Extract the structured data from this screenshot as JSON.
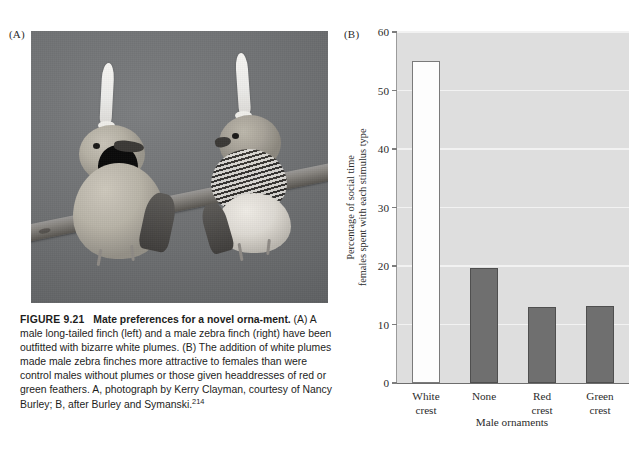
{
  "panels": {
    "a_label": "(A)",
    "b_label": "(B)"
  },
  "photo": {
    "alt_name": "two-finches-with-white-plumes-on-branch",
    "background_color": "#6f7173",
    "left_bird": "male long-tailed finch",
    "right_bird": "male zebra finch"
  },
  "caption": {
    "figure_number": "FIGURE 9.21",
    "title": "Mate preferences for a novel orna-­ment.",
    "body": " (A) A male long-tailed finch (left) and a male zebra finch (right) have been outfitted with bizarre white plumes. (B) The addition of white plumes made male zebra finches more attractive to females than were control males without plumes or those given headdresses of red or green feathers. A, photograph by Kerry Clayman, courtesy of Nancy Burley; B, after Burley and Symanski.",
    "reference": "214"
  },
  "chart_data": {
    "type": "bar",
    "title": "",
    "xlabel": "Male ornaments",
    "ylabel": "Percentage of social time females spent with each stimulus type",
    "ylabel_line1": "Percentage of social time",
    "ylabel_line2": "females spent with each stimulus type",
    "categories": [
      "White crest",
      "None",
      "Red crest",
      "Green crest"
    ],
    "category_lines": [
      [
        "White",
        "crest"
      ],
      [
        "None",
        ""
      ],
      [
        "Red",
        "crest"
      ],
      [
        "Green",
        "crest"
      ]
    ],
    "values": [
      55,
      19.7,
      13,
      13.2
    ],
    "bar_styles": [
      "hollow",
      "filled",
      "filled",
      "filled"
    ],
    "ylim": [
      0,
      60
    ],
    "yticks": [
      0,
      10,
      20,
      30,
      40,
      50,
      60
    ],
    "ytick_labels": [
      "0",
      "10",
      "20",
      "30",
      "40",
      "50",
      "60"
    ],
    "grid": true,
    "legend": "none",
    "plot_background": "#dedede",
    "gridline_color": "#f2f2f2",
    "bar_fill_color": "#6f6f6f",
    "bar_edge_color": "#4f4f4f",
    "hollow_bar_fill": "#fdfdfd"
  }
}
